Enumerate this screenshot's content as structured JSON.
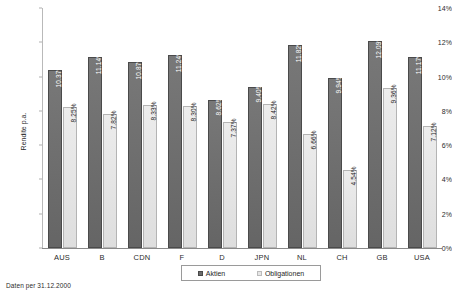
{
  "chart_data": {
    "type": "bar",
    "title": "",
    "xlabel": "",
    "ylabel": "Rendite p.a.",
    "ylim": [
      0,
      14
    ],
    "ytick_labels": [
      "14%",
      "12%",
      "10%",
      "8%",
      "6%",
      "4%",
      "2%",
      "0%"
    ],
    "ytick_values": [
      14,
      12,
      10,
      8,
      6,
      4,
      2,
      0
    ],
    "grid": false,
    "legend_position": "bottom",
    "categories": [
      "AUS",
      "B",
      "CDN",
      "F",
      "D",
      "JPN",
      "NL",
      "CH",
      "GB",
      "USA"
    ],
    "series": [
      {
        "name": "Aktien",
        "color": "#6e6e6e",
        "values": [
          10.37,
          11.14,
          10.87,
          11.24,
          8.62,
          9.4,
          11.82,
          9.94,
          12.09,
          11.17
        ],
        "labels": [
          "10.37%",
          "11.14%",
          "10.87%",
          "11.24%",
          "8.62%",
          "9.40%",
          "11.82%",
          "9.94%",
          "12.09%",
          "11.17%"
        ]
      },
      {
        "name": "Obligationen",
        "color": "#e3e3e3",
        "values": [
          8.25,
          7.82,
          8.33,
          8.3,
          7.37,
          8.42,
          6.66,
          4.54,
          9.36,
          7.12
        ],
        "labels": [
          "8.25%",
          "7.82%",
          "8.33%",
          "8.30%",
          "7.37%",
          "8.42%",
          "6.66%",
          "4.54%",
          "9.36%",
          "7.12%"
        ]
      }
    ]
  },
  "footnote": "Daten per 31.12.2000"
}
